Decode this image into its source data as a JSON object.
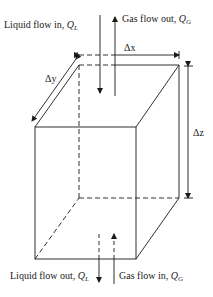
{
  "header": {
    "text": ""
  },
  "diagram": {
    "labels": {
      "liquid_in": {
        "text": "Liquid flow in, ",
        "symbol": "Q",
        "subscript": "L"
      },
      "gas_out": {
        "text": "Gas flow out, ",
        "symbol": "Q",
        "subscript": "G"
      },
      "liquid_out": {
        "text": "Liquid flow out, ",
        "symbol": "Q",
        "subscript": "L"
      },
      "gas_in": {
        "text": "Gas flow in, ",
        "symbol": "Q",
        "subscript": "G"
      },
      "dx": "Δx",
      "dy": "Δy",
      "dz": "Δz"
    },
    "colors": {
      "line": "#1a1a1a",
      "background": "#ffffff"
    }
  }
}
